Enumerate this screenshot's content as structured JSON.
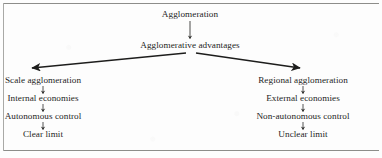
{
  "figure": {
    "title_node": "Agglomeration",
    "second_node": "Agglomerative advantages",
    "left_branch": {
      "items": [
        "Scale agglomeration",
        "Internal economies",
        "Autonomous control",
        "Clear limit"
      ]
    },
    "right_branch": {
      "items": [
        "Regional agglomeration",
        "External economies",
        "Non-autonomous control",
        "Unclear limit"
      ]
    },
    "colors": {
      "ink": "#1e1e1d",
      "rule": "#8d8d8a",
      "background": "#fdfdfd",
      "connector": "#2a2a28"
    }
  }
}
